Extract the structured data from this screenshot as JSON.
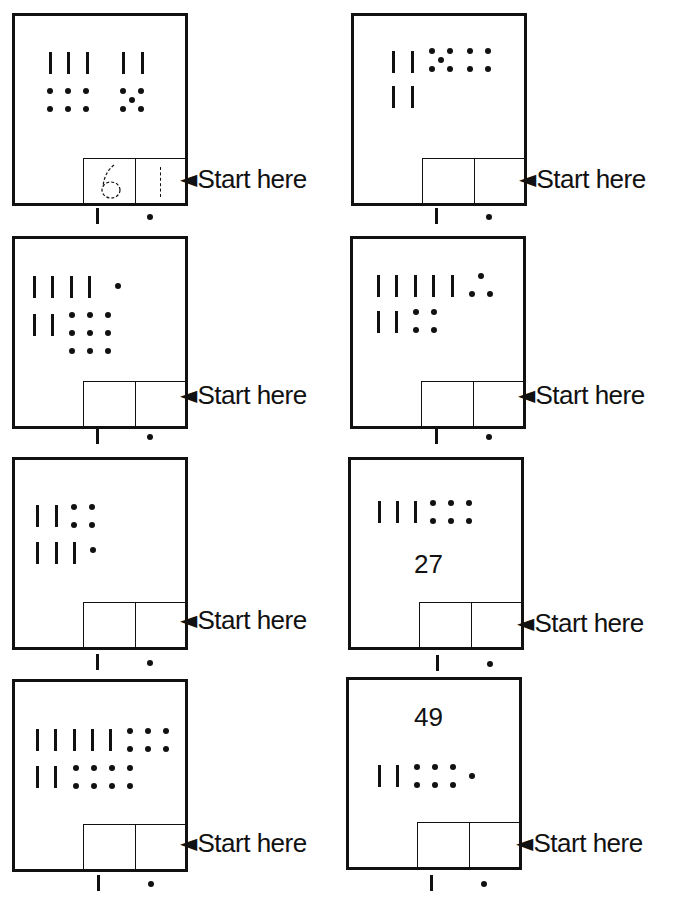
{
  "worksheet": {
    "start_label": "Start here",
    "column_labels": {
      "tens": "tens-stick",
      "ones": "ones-dot"
    },
    "panels": [
      {
        "id": 1,
        "tens_sticks": 5,
        "ones_dots": 11,
        "example_answer": {
          "tens": "6",
          "ones": "1"
        },
        "answer": {
          "tens": "",
          "ones": ""
        }
      },
      {
        "id": 2,
        "tens_sticks": 4,
        "ones_dots": 9,
        "answer": {
          "tens": "",
          "ones": ""
        }
      },
      {
        "id": 3,
        "tens_sticks": 6,
        "ones_dots": 10,
        "answer": {
          "tens": "",
          "ones": ""
        }
      },
      {
        "id": 4,
        "tens_sticks": 7,
        "ones_dots": 7,
        "answer": {
          "tens": "",
          "ones": ""
        }
      },
      {
        "id": 5,
        "tens_sticks": 5,
        "ones_dots": 5,
        "answer": {
          "tens": "",
          "ones": ""
        }
      },
      {
        "id": 6,
        "tens_sticks": 3,
        "ones_dots": 6,
        "printed_number": "27",
        "answer": {
          "tens": "",
          "ones": ""
        }
      },
      {
        "id": 7,
        "tens_sticks": 7,
        "ones_dots": 14,
        "answer": {
          "tens": "",
          "ones": ""
        }
      },
      {
        "id": 8,
        "tens_sticks": 2,
        "ones_dots": 7,
        "printed_number": "49",
        "answer": {
          "tens": "",
          "ones": ""
        }
      }
    ]
  },
  "labels": {
    "p1": {
      "start": "Start here",
      "tens": "6",
      "ones": "1"
    },
    "p6": {
      "number": "27"
    },
    "p8": {
      "number": "49"
    }
  }
}
